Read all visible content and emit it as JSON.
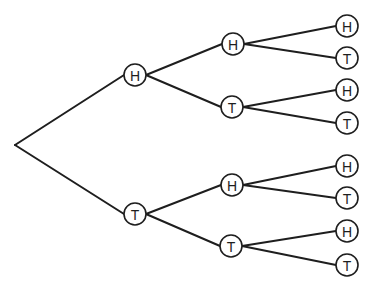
{
  "diagram": {
    "type": "probability-tree",
    "root": {
      "x": 15,
      "y": 145
    },
    "node_radius": 11,
    "colors": {
      "line": "#1e1e1e",
      "background": "#ffffff"
    },
    "nodes": [
      {
        "id": "n1",
        "label": "H",
        "x": 135,
        "y": 75,
        "parent": "root",
        "level": 1
      },
      {
        "id": "n2",
        "label": "T",
        "x": 135,
        "y": 214,
        "parent": "root",
        "level": 1
      },
      {
        "id": "n11",
        "label": "H",
        "x": 233,
        "y": 44,
        "parent": "n1",
        "level": 2
      },
      {
        "id": "n12",
        "label": "T",
        "x": 232,
        "y": 107,
        "parent": "n1",
        "level": 2
      },
      {
        "id": "n21",
        "label": "H",
        "x": 232,
        "y": 185,
        "parent": "n2",
        "level": 2
      },
      {
        "id": "n22",
        "label": "T",
        "x": 231,
        "y": 246,
        "parent": "n2",
        "level": 2
      },
      {
        "id": "n111",
        "label": "H",
        "x": 347,
        "y": 26,
        "parent": "n11",
        "level": 3
      },
      {
        "id": "n112",
        "label": "T",
        "x": 347,
        "y": 58,
        "parent": "n11",
        "level": 3
      },
      {
        "id": "n121",
        "label": "H",
        "x": 347,
        "y": 90,
        "parent": "n12",
        "level": 3
      },
      {
        "id": "n122",
        "label": "T",
        "x": 347,
        "y": 123,
        "parent": "n12",
        "level": 3
      },
      {
        "id": "n211",
        "label": "H",
        "x": 347,
        "y": 166,
        "parent": "n21",
        "level": 3
      },
      {
        "id": "n212",
        "label": "T",
        "x": 347,
        "y": 198,
        "parent": "n21",
        "level": 3
      },
      {
        "id": "n221",
        "label": "H",
        "x": 347,
        "y": 231,
        "parent": "n22",
        "level": 3
      },
      {
        "id": "n222",
        "label": "T",
        "x": 347,
        "y": 265,
        "parent": "n22",
        "level": 3
      }
    ]
  }
}
